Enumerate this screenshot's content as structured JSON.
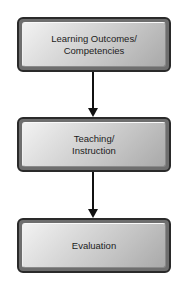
{
  "diagram": {
    "type": "flowchart",
    "direction": "top-to-bottom",
    "nodes": [
      {
        "id": "outcomes",
        "label": "Learning Outcomes/\nCompetencies"
      },
      {
        "id": "teaching",
        "label": "Teaching/\nInstruction"
      },
      {
        "id": "evaluation",
        "label": "Evaluation"
      }
    ],
    "edges": [
      {
        "from": "outcomes",
        "to": "teaching"
      },
      {
        "from": "teaching",
        "to": "evaluation"
      }
    ],
    "colors": {
      "box_border": "#2a2a2a",
      "box_fill_light": "#f2f2f2",
      "box_fill_dark": "#a9a9a9",
      "arrow": "#111111",
      "text": "#1c1c1c"
    }
  }
}
